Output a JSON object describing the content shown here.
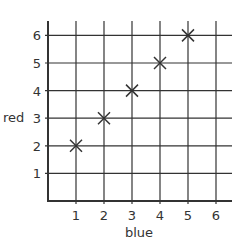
{
  "chart_data": {
    "type": "scatter",
    "title": "",
    "xlabel": "blue",
    "ylabel": "red",
    "x": [
      1,
      2,
      3,
      4,
      5
    ],
    "y": [
      2,
      3,
      4,
      5,
      6
    ],
    "series": [
      {
        "name": "points",
        "marker": "x",
        "points": [
          [
            1,
            2
          ],
          [
            2,
            3
          ],
          [
            3,
            4
          ],
          [
            4,
            5
          ],
          [
            5,
            6
          ]
        ]
      }
    ],
    "xticks": [
      1,
      2,
      3,
      4,
      5,
      6
    ],
    "yticks": [
      1,
      2,
      3,
      4,
      5,
      6
    ],
    "xlim": [
      0,
      6.5
    ],
    "ylim": [
      0,
      6.5
    ],
    "grid": true,
    "legend": null
  },
  "colors": {
    "grid": "#333333",
    "marker": "#333333",
    "text": "#333333"
  }
}
